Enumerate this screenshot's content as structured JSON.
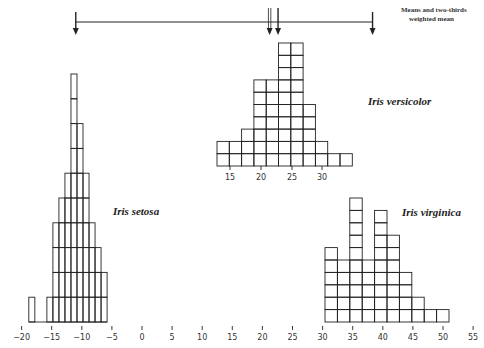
{
  "chart_data": {
    "type": "bar",
    "title": "",
    "xlabel": "",
    "ylabel": "",
    "xlim": [
      -20,
      55
    ],
    "x_ticks": [
      -20,
      -15,
      -10,
      -5,
      0,
      5,
      10,
      15,
      20,
      25,
      30,
      35,
      40,
      45,
      50,
      55
    ],
    "grid": false,
    "legend": null,
    "annotation": "Means and two-thirds weighted mean",
    "means_arrows": [
      {
        "name": "Iris setosa mean",
        "x": -11.0
      },
      {
        "name": "two-thirds weighted mean",
        "x": 21.2,
        "style": "double"
      },
      {
        "name": "Iris versicolor mean",
        "x": 22.6
      },
      {
        "name": "Iris virginica mean",
        "x": 38.3
      }
    ],
    "series": [
      {
        "name": "Iris setosa",
        "bin_start": -18.8,
        "bin_width": 1.0,
        "counts": [
          1,
          0,
          0,
          1,
          4,
          5,
          6,
          10,
          8,
          6,
          4,
          3,
          2
        ],
        "unit_height_px": 24.8
      },
      {
        "name": "Iris versicolor",
        "bin_start": 13.0,
        "bin_width": 2.0,
        "counts": [
          2,
          2,
          3,
          7,
          7,
          10,
          10,
          5,
          2,
          1,
          1
        ],
        "sub_axis_ticks": [
          15,
          20,
          25,
          30
        ]
      },
      {
        "name": "Iris virginica",
        "bin_start": 30.5,
        "bin_width": 2.0,
        "counts": [
          6,
          5,
          10,
          5,
          9,
          7,
          4,
          2,
          1,
          1
        ]
      }
    ]
  },
  "labels": {
    "setosa": "Iris setosa",
    "versicolor": "Iris versicolor",
    "virginica": "Iris virginica",
    "note_line1": "Means and two-thirds",
    "note_line2": "weighted mean"
  }
}
